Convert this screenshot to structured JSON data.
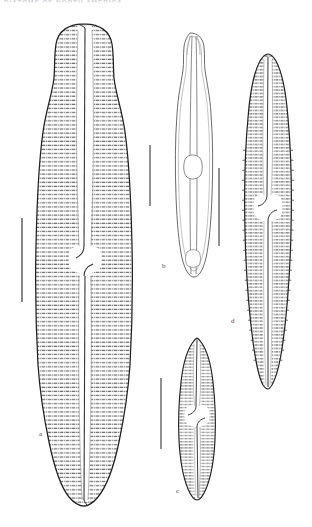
{
  "plate": {
    "header_text": "DIATOMS OF NORTH AMERICA",
    "background_color": "#ffffff",
    "ink_color": "#2b2b2b",
    "stria_color": "#6d6d6d",
    "width": 312,
    "height": 527
  },
  "figures": [
    {
      "id": "a",
      "label": "a",
      "name": "valve-a",
      "description": "Large panduriform valve with dense punctate striae, capitate apices, central stauros",
      "label_x": 39,
      "label_y": 434,
      "outline_color": "#222222",
      "scalebar": {
        "x": 22,
        "y_top": 218,
        "y_bottom": 302,
        "name": "scale-bar-a"
      }
    },
    {
      "id": "b",
      "label": "b",
      "name": "valve-b",
      "description": "Outline-only valve view showing raphe and central nodule, no striae",
      "label_x": 162,
      "label_y": 266,
      "outline_color": "#5a5a5a",
      "scalebar": {
        "x": 150,
        "y_top": 145,
        "y_bottom": 206,
        "name": "scale-bar-b"
      }
    },
    {
      "id": "c",
      "label": "c",
      "name": "valve-c",
      "description": "Small lanceolate valve with fine striae and narrow central area",
      "label_x": 177,
      "label_y": 492,
      "outline_color": "#222222",
      "scalebar": {
        "x": 161,
        "y_top": 378,
        "y_bottom": 449,
        "name": "scale-bar-c"
      }
    },
    {
      "id": "d",
      "label": "d",
      "name": "valve-d",
      "description": "Elongate linear-lanceolate valve with marginal tick striae and narrow axial area",
      "label_x": 232,
      "label_y": 322,
      "outline_color": "#222222",
      "scalebar": {
        "x": 219,
        "y_top": 168,
        "y_bottom": 246,
        "name": "scale-bar-d"
      }
    }
  ]
}
